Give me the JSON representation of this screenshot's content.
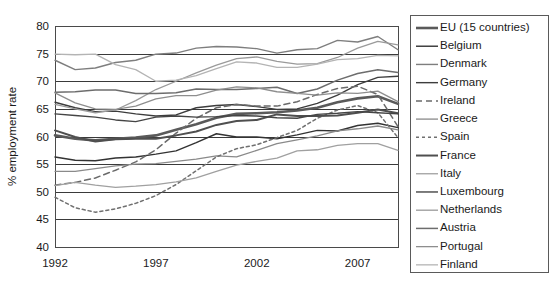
{
  "chart_data": {
    "type": "line",
    "title": "",
    "xlabel": "",
    "ylabel": "% employment rate",
    "ylim": [
      40,
      80
    ],
    "xlim": [
      1992,
      2009
    ],
    "yticks": [
      40,
      45,
      50,
      55,
      60,
      65,
      70,
      75,
      80
    ],
    "xticks": [
      1992,
      1997,
      2002,
      2007
    ],
    "xtick_labels": [
      "1992",
      "1997",
      "2002",
      "2007"
    ],
    "ytick_labels": [
      "40",
      "45",
      "50",
      "55",
      "60",
      "65",
      "70",
      "75",
      "80"
    ],
    "grid": "horizontal",
    "legend_position": "right-outside",
    "x": [
      1992,
      1993,
      1994,
      1995,
      1996,
      1997,
      1998,
      1999,
      2000,
      2001,
      2002,
      2003,
      2004,
      2005,
      2006,
      2007,
      2008,
      2009
    ],
    "series": [
      {
        "name": "EU (15 countries)",
        "color": "#5a5a5a",
        "width": 2.6,
        "dash": "none",
        "values": [
          60.2,
          59.6,
          59.3,
          59.6,
          59.8,
          60.2,
          61.2,
          62.2,
          63.4,
          64.1,
          64.2,
          64.4,
          64.7,
          65.2,
          66.2,
          66.9,
          67.3,
          65.9
        ]
      },
      {
        "name": "Belgium",
        "color": "#333333",
        "width": 1.4,
        "dash": "none",
        "values": [
          56.3,
          55.7,
          55.6,
          56.1,
          56.3,
          56.8,
          57.4,
          58.9,
          60.5,
          59.9,
          59.9,
          59.6,
          60.3,
          61.1,
          61.0,
          62.0,
          62.4,
          61.6
        ]
      },
      {
        "name": "Denmark",
        "color": "#7e7e7e",
        "width": 1.4,
        "dash": "none",
        "values": [
          73.8,
          72.1,
          72.4,
          73.4,
          73.8,
          74.9,
          75.1,
          76.0,
          76.3,
          76.2,
          75.9,
          75.1,
          75.7,
          75.9,
          77.4,
          77.1,
          78.1,
          75.7
        ]
      },
      {
        "name": "Germany",
        "color": "#3d3d3d",
        "width": 1.4,
        "dash": "none",
        "values": [
          66.2,
          65.2,
          64.5,
          64.6,
          64.1,
          63.7,
          63.9,
          65.2,
          65.6,
          65.8,
          65.4,
          64.9,
          65.0,
          66.0,
          67.5,
          69.4,
          70.7,
          70.9
        ]
      },
      {
        "name": "Ireland",
        "color": "#6a6a6a",
        "width": 1.5,
        "dash": "6,4",
        "values": [
          51.2,
          51.7,
          52.5,
          53.9,
          55.4,
          57.6,
          60.6,
          63.3,
          65.2,
          65.8,
          65.5,
          65.5,
          66.3,
          67.6,
          68.7,
          69.1,
          67.6,
          61.8
        ]
      },
      {
        "name": "Greece",
        "color": "#8a8a8a",
        "width": 1.3,
        "dash": "none",
        "values": [
          53.7,
          53.7,
          54.2,
          54.7,
          55.0,
          55.1,
          55.5,
          55.9,
          56.5,
          56.3,
          57.5,
          58.7,
          59.4,
          60.1,
          61.0,
          61.4,
          61.9,
          61.2
        ]
      },
      {
        "name": "Spain",
        "color": "#707070",
        "width": 1.5,
        "dash": "3,3",
        "values": [
          49.0,
          47.1,
          46.3,
          46.9,
          47.9,
          49.3,
          51.3,
          53.8,
          56.3,
          57.8,
          58.5,
          59.8,
          61.1,
          63.3,
          64.8,
          65.6,
          64.3,
          59.8
        ]
      },
      {
        "name": "France",
        "color": "#4f4f4f",
        "width": 2.0,
        "dash": "none",
        "values": [
          61.1,
          59.9,
          59.1,
          59.5,
          59.6,
          59.6,
          60.2,
          60.9,
          62.1,
          62.8,
          63.0,
          64.0,
          63.7,
          63.7,
          63.8,
          64.3,
          64.9,
          64.2
        ]
      },
      {
        "name": "Italy",
        "color": "#a0a0a0",
        "width": 1.3,
        "dash": "none",
        "values": [
          51.1,
          51.7,
          51.2,
          50.8,
          51.0,
          51.3,
          51.8,
          52.5,
          53.7,
          54.8,
          55.5,
          56.1,
          57.4,
          57.6,
          58.4,
          58.7,
          58.7,
          57.5
        ]
      },
      {
        "name": "Luxembourg",
        "color": "#454545",
        "width": 1.4,
        "dash": "none",
        "values": [
          64.1,
          63.8,
          63.5,
          63.0,
          62.7,
          63.5,
          63.7,
          63.5,
          63.6,
          63.8,
          63.7,
          63.4,
          63.3,
          64.0,
          64.2,
          64.5,
          64.3,
          64.1
        ]
      },
      {
        "name": "Netherlands",
        "color": "#9a9a9a",
        "width": 1.3,
        "dash": "none",
        "values": [
          65.8,
          65.0,
          64.3,
          64.8,
          66.5,
          68.5,
          70.0,
          71.5,
          72.9,
          74.1,
          74.4,
          73.6,
          73.1,
          73.2,
          74.3,
          76.0,
          77.2,
          76.6
        ]
      },
      {
        "name": "Austria",
        "color": "#6d6d6d",
        "width": 1.5,
        "dash": "none",
        "values": [
          68.0,
          68.1,
          68.4,
          68.4,
          67.8,
          67.8,
          67.9,
          68.6,
          68.5,
          68.5,
          68.7,
          68.9,
          67.8,
          68.6,
          70.2,
          71.4,
          72.1,
          71.6
        ]
      },
      {
        "name": "Portugal",
        "color": "#8e8e8e",
        "width": 1.3,
        "dash": "none",
        "values": [
          67.9,
          66.1,
          65.0,
          64.9,
          65.5,
          66.8,
          67.4,
          67.4,
          68.4,
          69.0,
          68.8,
          68.1,
          67.8,
          67.5,
          67.9,
          67.8,
          68.2,
          66.3
        ]
      },
      {
        "name": "Finland",
        "color": "#b4b4b4",
        "width": 1.3,
        "dash": "none",
        "values": [
          74.9,
          74.8,
          74.9,
          73.0,
          72.1,
          70.0,
          70.2,
          71.0,
          72.3,
          73.5,
          73.3,
          72.5,
          72.5,
          73.1,
          73.9,
          74.1,
          74.7,
          74.6
        ]
      }
    ]
  },
  "layout": {
    "plot": {
      "left": 55,
      "top": 26,
      "right": 398,
      "bottom": 247
    },
    "legend": {
      "left": 410,
      "top": 15,
      "right": 548,
      "bottom": 272
    }
  }
}
